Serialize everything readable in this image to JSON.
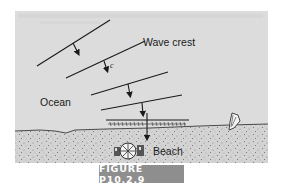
{
  "figure": {
    "caption": "FIGURE P10.2.9",
    "labels": {
      "wave_crest": "Wave crest",
      "celerity": "c",
      "ocean": "Ocean",
      "beach": "Beach"
    },
    "icons": [
      "beach-umbrella-icon",
      "surfboard-icon"
    ],
    "colors": {
      "ocean_panel": "#dcdcdc",
      "sand": "#d2d2d2",
      "lines": "#1a1a1a",
      "caption_bg": "#8e8e8e",
      "caption_text": "#ffffff"
    }
  }
}
